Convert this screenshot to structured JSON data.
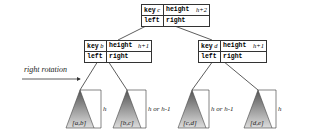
{
  "nodes": {
    "root": {
      "key_label": "key",
      "key": "c",
      "height_label": "height",
      "height": "h+2",
      "left": "left",
      "right": "right"
    },
    "left": {
      "key_label": "key",
      "key": "b",
      "height_label": "height",
      "height": "h+1",
      "left": "left",
      "right": "right"
    },
    "right": {
      "key_label": "key",
      "key": "d",
      "height_label": "height",
      "height": "h+1",
      "left": "left",
      "right": "right"
    }
  },
  "subtrees": [
    {
      "range": "[a,b]",
      "height": "h"
    },
    {
      "range": "[b,c]",
      "height": "h or h-1"
    },
    {
      "range": "[c,d]",
      "height": "h or h-1"
    },
    {
      "range": "[d,e]",
      "height": "h"
    }
  ],
  "annotation": "right rotation"
}
